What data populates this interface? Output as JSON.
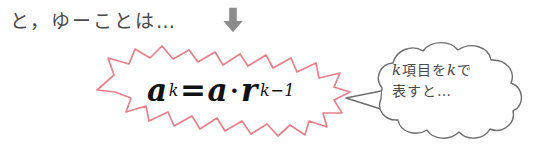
{
  "page": {
    "background_color": "#ffffff",
    "width": 541,
    "height": 157
  },
  "intro": {
    "text": "と，ゆーことは…"
  },
  "arrow": {
    "icon": "arrow-down-icon",
    "direction": "down",
    "color": "#8c8c8c"
  },
  "starburst": {
    "outline_color": "#e8808a",
    "fill_color": "#ffffff",
    "formula": {
      "full_text": "a_k = a · r^(k-1)",
      "base_left": "a",
      "subscript_left": "k",
      "equals": "=",
      "base_right": "a",
      "dot": "·",
      "variable": "r",
      "exponent": "k−1"
    }
  },
  "speech_bubble": {
    "outline_color": "#6e6e6e",
    "fill_color": "#ffffff",
    "shape": "cloud",
    "tail_direction": "left",
    "lines": [
      {
        "prefix": "k",
        "middle": "項目を",
        "var2": "k",
        "suffix": "で"
      },
      {
        "text": "表すと…"
      }
    ],
    "line1_plain": "k項目をkで",
    "line2_plain": "表すと…"
  }
}
